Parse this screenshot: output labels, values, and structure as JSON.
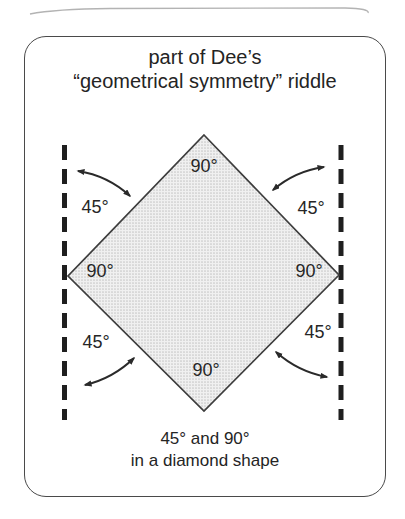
{
  "figure": {
    "title_line1": "part of Dee’s",
    "title_line2": "“geometrical symmetry” riddle",
    "caption_line1": "45° and 90°",
    "caption_line2": "in a diamond shape",
    "angles": {
      "corner_top": "90°",
      "corner_left": "90°",
      "corner_right": "90°",
      "corner_bottom": "90°",
      "between_top_left": "45°",
      "between_top_right": "45°",
      "between_bottom_left": "45°",
      "between_bottom_right": "45°"
    },
    "colors": {
      "diamond_fill": "#ececec",
      "diamond_dot": "#c8c8c8",
      "line": "#2a2a2a",
      "border": "#4a4a4a",
      "background": "#ffffff"
    }
  }
}
